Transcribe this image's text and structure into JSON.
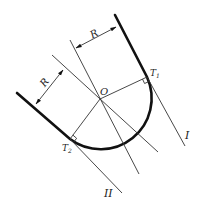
{
  "diagram": {
    "title": "",
    "labels": {
      "radius_top": "R",
      "radius_left": "R",
      "center": "O",
      "tangent_1": "T",
      "tangent_1_sub": "1",
      "tangent_2": "T",
      "tangent_2_sub": "2",
      "line_1": "I",
      "line_2": "II"
    },
    "geometry": {
      "center": [
        100,
        99
      ],
      "radius": 51,
      "T1": [
        147,
        77
      ],
      "T2": [
        70,
        139
      ]
    },
    "colors": {
      "stroke": "#111111",
      "thin_stroke": "#333333",
      "background": "#ffffff"
    }
  }
}
